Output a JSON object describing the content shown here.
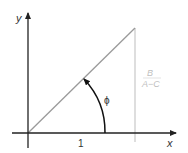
{
  "diagram": {
    "axes": {
      "x_label": "x",
      "y_label": "y"
    },
    "tick_label": "1",
    "angle_label": "ϕ",
    "fraction": {
      "numerator": "B",
      "denominator": "A−C"
    },
    "colors": {
      "axis": "#222222",
      "diagonal": "#9a9a9a",
      "vertical_line": "#c8c8c8",
      "arc": "#111111",
      "fraction_text": "#c0c0c0"
    }
  }
}
